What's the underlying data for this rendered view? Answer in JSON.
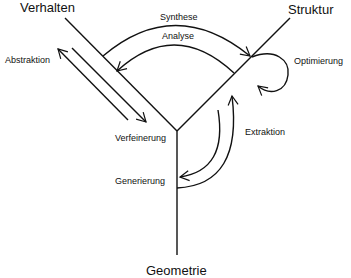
{
  "diagram": {
    "type": "Y-chart",
    "axes": {
      "behavior": "Verhalten",
      "structure": "Struktur",
      "geometry": "Geometrie"
    },
    "transitions": {
      "synthesis": "Synthese",
      "analysis": "Analyse",
      "abstraction": "Abstraktion",
      "refinement": "Verfeinerung",
      "optimization": "Optimierung",
      "extraction": "Extraktion",
      "generation": "Generierung"
    },
    "colors": {
      "stroke": "#111111",
      "background": "#ffffff"
    }
  }
}
